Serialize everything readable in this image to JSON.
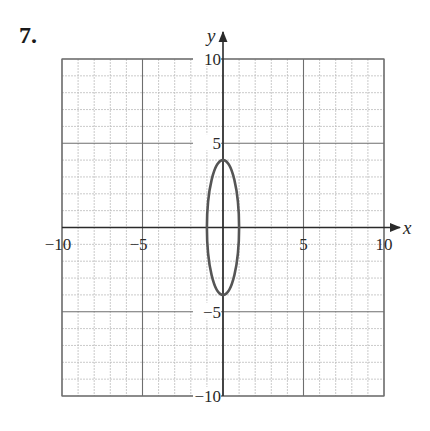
{
  "problem": {
    "number": "7."
  },
  "chart_data": {
    "type": "line",
    "title": "",
    "xlabel": "x",
    "ylabel": "y",
    "xlim": [
      -10,
      10
    ],
    "ylim": [
      -10,
      10
    ],
    "grid": {
      "on": true,
      "minor_step": 1,
      "major_step": 5
    },
    "x_tick_labels": [
      "−10",
      "−5",
      "5",
      "10"
    ],
    "x_tick_values": [
      -10,
      -5,
      5,
      10
    ],
    "y_tick_labels": [
      "10",
      "5",
      "−5",
      "−10"
    ],
    "y_tick_values": [
      10,
      5,
      -5,
      -10
    ],
    "series": [
      {
        "name": "ellipse",
        "shape": "ellipse",
        "center": [
          0,
          0
        ],
        "semi_axis_x": 1,
        "semi_axis_y": 4,
        "equation": "x^2/1 + y^2/16 = 1",
        "vertices": [
          [
            0,
            4
          ],
          [
            0,
            -4
          ]
        ],
        "co_vertices": [
          [
            1,
            0
          ],
          [
            -1,
            0
          ]
        ]
      }
    ],
    "legend": null
  },
  "colors": {
    "grid_minor": "#bdbdbd",
    "grid_major": "#6e6e6e",
    "axis": "#2a2a2a",
    "curve": "#555555"
  }
}
